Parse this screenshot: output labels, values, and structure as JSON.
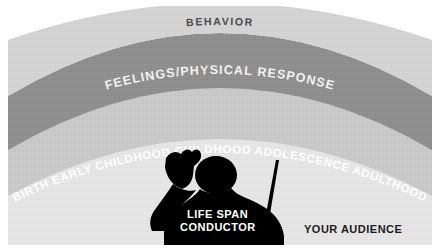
{
  "figure": {
    "title_alt": "Life Span Conductor concentric arc diagram",
    "bands": [
      {
        "id": "behavior",
        "label": "BEHAVIOR",
        "fill": "#d4d4d4",
        "text_color": "#4a4a4a"
      },
      {
        "id": "feelings",
        "label": "FEELINGS/PHYSICAL RESPONSE",
        "fill": "#8d8d8d",
        "text_color": "#f2f2f2"
      },
      {
        "id": "lifespan",
        "label": "",
        "fill": "#c6c6c6",
        "text_color": "#ffffff"
      },
      {
        "id": "audience",
        "label": "",
        "fill": "#e2e2e2",
        "text_color": "#1c1c1c"
      }
    ],
    "life_stages": [
      {
        "label": "BIRTH"
      },
      {
        "label": "EARLY CHILDHOOD"
      },
      {
        "label": "CHILDHOOD"
      },
      {
        "label": "ADOLESCENCE"
      },
      {
        "label": "ADULTHOOD"
      }
    ],
    "life_stages_joined": "BIRTH   EARLY CHILDHOOD   CHILDHOOD   ADOLESCENCE   ADULTHOOD",
    "conductor": {
      "label_line1": "LIFE SPAN",
      "label_line2": "CONDUCTOR",
      "silhouette_color": "#000000",
      "icon": "conductor-silhouette-icon"
    },
    "audience": {
      "label": "YOUR AUDIENCE",
      "color": "#1c1c1c"
    },
    "background": "#ffffff",
    "canvas": {
      "width": 440,
      "height": 251
    }
  }
}
